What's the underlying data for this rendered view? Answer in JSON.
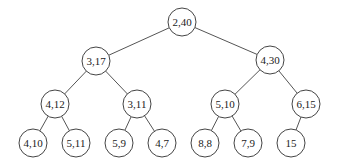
{
  "diagram": {
    "type": "binary-tree",
    "nodes": [
      {
        "id": "n0",
        "label": "2,40",
        "x": 182,
        "y": 22
      },
      {
        "id": "n1",
        "label": "3,17",
        "x": 96,
        "y": 61
      },
      {
        "id": "n2",
        "label": "4,30",
        "x": 270,
        "y": 60
      },
      {
        "id": "n3",
        "label": "4,12",
        "x": 55,
        "y": 104
      },
      {
        "id": "n4",
        "label": "3,11",
        "x": 137,
        "y": 104
      },
      {
        "id": "n5",
        "label": "5,10",
        "x": 225,
        "y": 104
      },
      {
        "id": "n6",
        "label": "6,15",
        "x": 306,
        "y": 104
      },
      {
        "id": "n7",
        "label": "4,10",
        "x": 33,
        "y": 143
      },
      {
        "id": "n8",
        "label": "5,11",
        "x": 76,
        "y": 143
      },
      {
        "id": "n9",
        "label": "5,9",
        "x": 119,
        "y": 143
      },
      {
        "id": "n10",
        "label": "4,7",
        "x": 162,
        "y": 143
      },
      {
        "id": "n11",
        "label": "8,8",
        "x": 205,
        "y": 143
      },
      {
        "id": "n12",
        "label": "7,9",
        "x": 248,
        "y": 143
      },
      {
        "id": "n13",
        "label": "15",
        "x": 291,
        "y": 143
      }
    ],
    "edges": [
      [
        "n0",
        "n1"
      ],
      [
        "n0",
        "n2"
      ],
      [
        "n1",
        "n3"
      ],
      [
        "n1",
        "n4"
      ],
      [
        "n2",
        "n5"
      ],
      [
        "n2",
        "n6"
      ],
      [
        "n3",
        "n7"
      ],
      [
        "n3",
        "n8"
      ],
      [
        "n4",
        "n9"
      ],
      [
        "n4",
        "n10"
      ],
      [
        "n5",
        "n11"
      ],
      [
        "n5",
        "n12"
      ],
      [
        "n6",
        "n13"
      ]
    ],
    "radius": 14
  }
}
